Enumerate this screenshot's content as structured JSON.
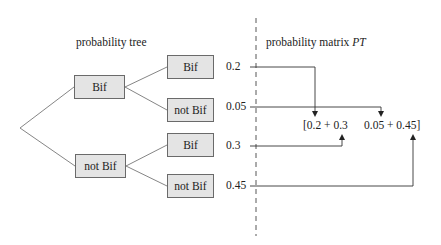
{
  "tree": {
    "title": "probability tree",
    "level1": [
      {
        "label": "Bif"
      },
      {
        "label": "not Bif"
      }
    ],
    "level2": [
      {
        "label": "Bif",
        "probability": "0.2"
      },
      {
        "label": "not Bif",
        "probability": "0.05"
      },
      {
        "label": "Bif",
        "probability": "0.3"
      },
      {
        "label": "not Bif",
        "probability": "0.45"
      }
    ]
  },
  "matrix": {
    "title_prefix": "probability matrix ",
    "title_symbol": "PT",
    "left_entry": "[0.2 + 0.3",
    "right_entry": "0.05 + 0.45]"
  },
  "colors": {
    "box_fill": "#e4e4e4",
    "box_border": "#6a6a6a",
    "line": "#555555",
    "arrow": "#222222"
  }
}
